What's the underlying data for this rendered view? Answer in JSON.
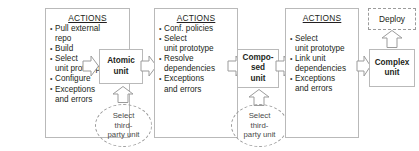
{
  "diagram": {
    "colors": {
      "background": "#ffffff",
      "border": "#b9b9b9",
      "dashed_border": "#9b9b9b",
      "text": "#231f20",
      "muted_text": "#4a4a4a"
    },
    "stages": [
      {
        "id": "stage-1",
        "actions_heading": "ACTIONS",
        "actions": [
          "Pull external\nrepo",
          "Build",
          "Select\nunit prototype",
          "Configure",
          "Exceptions\nand errors"
        ],
        "unit": "Atomic\nunit",
        "source": "Select\nthird-\nparty unit"
      },
      {
        "id": "stage-2",
        "actions_heading": "ACTIONS",
        "actions": [
          "Conf. policies",
          "Select\nunit prototype",
          "Resolve\ndependencies",
          "Exceptions\nand errors"
        ],
        "unit": "Compo-\nsed\nunit",
        "source": "Select\nthird-\nparty unit"
      },
      {
        "id": "stage-3",
        "actions_heading": "ACTIONS",
        "actions": [
          "Select\nunit prototype",
          "Link unit\ndependencies",
          "Exceptions\nand errors"
        ],
        "unit": "Complex\nunit",
        "source": null
      }
    ],
    "deploy": {
      "label": "Deploy"
    },
    "arrows": {
      "right_arrow_icon": "block-arrow-right",
      "up_arrow_icon": "block-arrow-up"
    }
  }
}
